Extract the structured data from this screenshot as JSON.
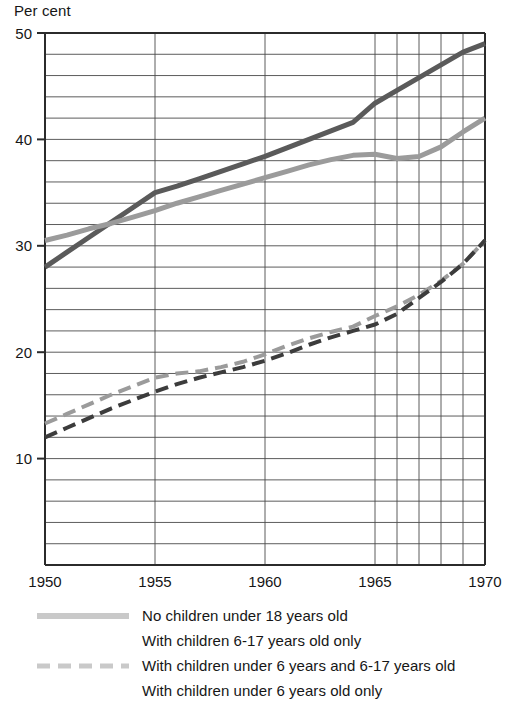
{
  "chart_data": {
    "type": "line",
    "title": "Per cent",
    "xlabel": "",
    "ylabel": "Per cent",
    "xlim": [
      1950,
      1970
    ],
    "ylim": [
      0,
      50
    ],
    "y_tick_labels": [
      "50",
      "40",
      "30",
      "20",
      "10"
    ],
    "y_tick_values": [
      50,
      40,
      30,
      20,
      10
    ],
    "y_gridline_step": 2,
    "x_tick_labels": [
      "1950",
      "1955",
      "1960",
      "1965",
      "1970"
    ],
    "x_tick_values": [
      1950,
      1955,
      1960,
      1965,
      1970
    ],
    "x_gridline_values": [
      1950,
      1955,
      1960,
      1965,
      1966,
      1967,
      1968,
      1969,
      1970
    ],
    "grid": true,
    "legend_position": "below",
    "series": [
      {
        "name": "No children under 18 years old",
        "color": "#5a5a5a",
        "style": "solid",
        "width": 5,
        "x": [
          1950,
          1951,
          1952,
          1953,
          1954,
          1955,
          1956,
          1957,
          1958,
          1959,
          1960,
          1961,
          1962,
          1963,
          1964,
          1965,
          1966,
          1967,
          1968,
          1969,
          1970
        ],
        "values": [
          28.0,
          29.4,
          30.8,
          32.2,
          33.6,
          35.0,
          35.6,
          36.3,
          37.0,
          37.7,
          38.4,
          39.2,
          40.0,
          40.8,
          41.6,
          43.4,
          44.6,
          45.8,
          47.0,
          48.2,
          49.0
        ]
      },
      {
        "name": "With children 6-17 years old only",
        "color": "#9b9b9b",
        "style": "solid",
        "width": 5,
        "x": [
          1950,
          1951,
          1952,
          1953,
          1954,
          1955,
          1956,
          1957,
          1958,
          1959,
          1960,
          1961,
          1962,
          1963,
          1964,
          1965,
          1966,
          1967,
          1968,
          1969,
          1970
        ],
        "values": [
          30.5,
          31.0,
          31.6,
          32.1,
          32.7,
          33.3,
          34.0,
          34.6,
          35.2,
          35.8,
          36.4,
          37.0,
          37.6,
          38.1,
          38.5,
          38.6,
          38.2,
          38.4,
          39.3,
          40.7,
          42.0
        ]
      },
      {
        "name": "With children under 6 years and 6-17 years old",
        "color": "#9b9b9b",
        "style": "dashed",
        "width": 4,
        "x": [
          1950,
          1951,
          1952,
          1953,
          1954,
          1955,
          1956,
          1957,
          1958,
          1959,
          1960,
          1961,
          1962,
          1963,
          1964,
          1965,
          1966,
          1967,
          1968,
          1969,
          1970
        ],
        "values": [
          13.3,
          14.2,
          15.1,
          16.0,
          16.8,
          17.6,
          18.0,
          18.2,
          18.6,
          19.1,
          19.8,
          20.6,
          21.3,
          21.9,
          22.4,
          23.4,
          24.3,
          25.4,
          26.7,
          28.3,
          30.5
        ]
      },
      {
        "name": "With children under 6 years old only",
        "color": "#3c3c3c",
        "style": "dashed",
        "width": 4,
        "x": [
          1950,
          1951,
          1952,
          1953,
          1954,
          1955,
          1956,
          1957,
          1958,
          1959,
          1960,
          1961,
          1962,
          1963,
          1964,
          1965,
          1966,
          1967,
          1968,
          1969,
          1970
        ],
        "values": [
          12.0,
          12.9,
          13.8,
          14.7,
          15.5,
          16.3,
          17.0,
          17.6,
          18.1,
          18.6,
          19.2,
          19.9,
          20.7,
          21.4,
          22.0,
          22.6,
          23.6,
          25.1,
          26.6,
          28.3,
          30.5
        ]
      }
    ]
  },
  "legend": {
    "items": [
      {
        "label": "No children under 18 years old",
        "swatch": "thick-gray-solid",
        "show_swatch": true
      },
      {
        "label": "With children 6-17 years old only",
        "swatch": "none",
        "show_swatch": false
      },
      {
        "label": "With children under 6 years and 6-17 years old",
        "swatch": "gray-dashed",
        "show_swatch": true
      },
      {
        "label": "With children under 6 years old only",
        "swatch": "none",
        "show_swatch": false
      }
    ]
  },
  "colors": {
    "axis": "#2b2b2b",
    "grid": "#4a4a4a",
    "text": "#161616",
    "series_dark_solid": "#5a5a5a",
    "series_light_solid": "#9b9b9b",
    "series_light_dashed": "#9b9b9b",
    "series_dark_dashed": "#3c3c3c",
    "legend_swatch": "#c9c9c9"
  }
}
